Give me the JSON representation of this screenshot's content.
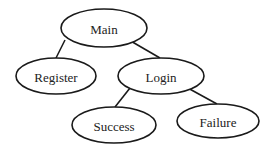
{
  "diagram": {
    "type": "tree",
    "nodes": [
      {
        "id": "main",
        "label": "Main",
        "cx": 104,
        "cy": 28,
        "rx": 43,
        "ry": 19
      },
      {
        "id": "register",
        "label": "Register",
        "cx": 56,
        "cy": 76,
        "rx": 40,
        "ry": 18
      },
      {
        "id": "login",
        "label": "Login",
        "cx": 161,
        "cy": 76,
        "rx": 43,
        "ry": 18
      },
      {
        "id": "success",
        "label": "Success",
        "cx": 114,
        "cy": 125,
        "rx": 42,
        "ry": 18
      },
      {
        "id": "failure",
        "label": "Failure",
        "cx": 218,
        "cy": 121,
        "rx": 41,
        "ry": 17
      }
    ],
    "edges": [
      {
        "from": "main",
        "to": "register",
        "x1": 65,
        "y1": 40,
        "x2": 56,
        "y2": 58
      },
      {
        "from": "main",
        "to": "login",
        "x1": 129,
        "y1": 40,
        "x2": 160,
        "y2": 58
      },
      {
        "from": "login",
        "to": "success",
        "x1": 130,
        "y1": 88,
        "x2": 115,
        "y2": 107
      },
      {
        "from": "login",
        "to": "failure",
        "x1": 186,
        "y1": 87,
        "x2": 217,
        "y2": 104
      }
    ],
    "colors": {
      "stroke": "#1a1a1a",
      "text": "#222222",
      "background": "#ffffff"
    }
  }
}
